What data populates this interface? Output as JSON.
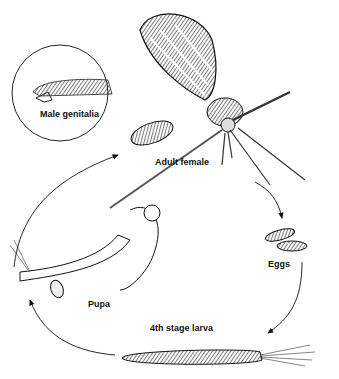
{
  "diagram": {
    "type": "life-cycle",
    "stages": [
      {
        "id": "adult",
        "label": "Adult female"
      },
      {
        "id": "eggs",
        "label": "Eggs"
      },
      {
        "id": "larva",
        "label": "4th stage larva"
      },
      {
        "id": "pupa",
        "label": "Pupa"
      }
    ],
    "inset": {
      "label": "Male genitalia"
    },
    "cycle_order": [
      "Adult female",
      "Eggs",
      "4th stage larva",
      "Pupa",
      "Adult female"
    ],
    "colors": {
      "ink": "#111111",
      "background": "#ffffff"
    }
  }
}
